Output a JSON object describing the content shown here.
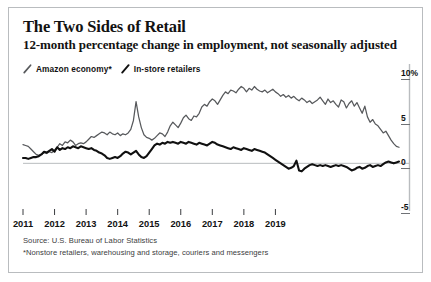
{
  "card": {
    "title": "The Two Sides of Retail",
    "subtitle": "12-month percentage change in employment, not seasonally adjusted",
    "source": "Source: U.S. Bureau of Labor Statistics",
    "footnote": "*Nonstore retailers, warehousing and storage, couriers and messengers",
    "border_color": "#b9bcbf",
    "background": "#ffffff"
  },
  "legend": {
    "position": "top-left",
    "entries": [
      {
        "label": "Amazon economy*",
        "color": "#57595c",
        "marker": "slash-line"
      },
      {
        "label": "In-store retailers",
        "color": "#101010",
        "marker": "slash-line"
      }
    ]
  },
  "chart_data": {
    "type": "line",
    "title": "The Two Sides of Retail",
    "subtitle": "12-month percentage change in employment, not seasonally adjusted",
    "xlabel": "",
    "ylabel": "",
    "grid": false,
    "zero_line": true,
    "ylim": [
      -5,
      10
    ],
    "yticks": [
      10,
      5,
      0,
      -5
    ],
    "ytick_labels": [
      "10%",
      "5",
      "0",
      "-5"
    ],
    "xlim": [
      "2011-01",
      "2019-12"
    ],
    "xticks": [
      "2011",
      "2012",
      "2013",
      "2014",
      "2015",
      "2016",
      "2017",
      "2018",
      "2019"
    ],
    "x_step_months": 1,
    "series": [
      {
        "name": "Amazon economy*",
        "color": "#57595c",
        "start": "2011-01",
        "values": [
          2.1,
          2.0,
          1.9,
          1.6,
          1.3,
          1.0,
          0.9,
          1.0,
          1.2,
          1.1,
          1.3,
          1.2,
          1.5,
          1.8,
          2.2,
          2.0,
          2.4,
          2.3,
          2.6,
          2.4,
          2.0,
          2.2,
          2.3,
          2.2,
          2.4,
          2.7,
          3.0,
          2.9,
          3.1,
          3.3,
          3.5,
          3.4,
          3.2,
          3.5,
          3.3,
          3.2,
          3.4,
          3.1,
          3.3,
          3.2,
          3.4,
          3.8,
          4.8,
          6.9,
          5.2,
          4.0,
          3.2,
          2.9,
          2.8,
          2.6,
          2.8,
          3.1,
          3.4,
          3.3,
          3.0,
          3.5,
          4.2,
          4.6,
          4.3,
          4.0,
          4.5,
          5.1,
          5.4,
          5.0,
          4.8,
          5.3,
          5.2,
          5.6,
          6.3,
          6.6,
          6.4,
          6.9,
          7.2,
          7.0,
          6.6,
          7.1,
          7.6,
          8.0,
          7.8,
          8.2,
          8.1,
          7.9,
          8.3,
          8.6,
          8.4,
          8.0,
          8.4,
          8.2,
          8.6,
          8.3,
          8.1,
          8.0,
          8.2,
          7.9,
          8.1,
          8.3,
          8.0,
          7.8,
          7.5,
          7.7,
          7.4,
          7.6,
          7.3,
          7.5,
          7.2,
          7.0,
          7.3,
          7.1,
          6.8,
          7.0,
          6.7,
          6.9,
          7.1,
          7.4,
          7.0,
          6.6,
          7.2,
          6.8,
          7.0,
          6.6,
          6.3,
          7.1,
          6.9,
          6.2,
          6.7,
          7.0,
          6.4,
          6.8,
          6.2,
          5.6,
          6.4,
          5.2,
          4.6,
          4.9,
          4.4,
          4.2,
          3.8,
          3.4,
          3.6,
          3.1,
          2.6,
          2.2,
          1.9,
          1.8
        ]
      },
      {
        "name": "In-store retailers",
        "color": "#101010",
        "start": "2011-01",
        "values": [
          0.6,
          0.6,
          0.5,
          0.6,
          0.7,
          0.7,
          0.8,
          1.0,
          1.3,
          1.2,
          1.4,
          1.6,
          1.3,
          1.8,
          1.5,
          1.7,
          1.6,
          1.8,
          1.7,
          1.9,
          1.8,
          1.7,
          1.9,
          1.8,
          1.7,
          1.6,
          1.7,
          1.5,
          1.4,
          1.2,
          1.1,
          0.9,
          0.6,
          0.5,
          0.6,
          0.7,
          0.6,
          0.8,
          1.1,
          1.3,
          1.2,
          1.0,
          1.2,
          1.4,
          1.0,
          0.7,
          0.6,
          0.8,
          1.2,
          1.6,
          2.0,
          2.2,
          2.1,
          2.3,
          2.2,
          2.4,
          2.3,
          2.4,
          2.3,
          2.2,
          2.4,
          2.3,
          2.2,
          2.4,
          2.3,
          2.2,
          2.1,
          2.3,
          2.2,
          2.1,
          2.0,
          2.2,
          2.4,
          2.3,
          2.1,
          2.0,
          1.9,
          1.8,
          1.7,
          1.6,
          1.8,
          1.7,
          1.6,
          1.5,
          1.7,
          1.6,
          1.5,
          1.4,
          1.6,
          1.5,
          1.4,
          1.3,
          1.2,
          1.0,
          0.8,
          0.6,
          0.4,
          0.2,
          0.0,
          -0.2,
          -0.4,
          -0.6,
          -0.5,
          -0.3,
          0.3,
          -0.8,
          -0.9,
          -0.6,
          -0.4,
          -0.2,
          -0.1,
          -0.2,
          -0.3,
          -0.2,
          -0.3,
          -0.2,
          -0.3,
          -0.4,
          -0.3,
          -0.2,
          -0.3,
          -0.2,
          -0.3,
          -0.4,
          -0.6,
          -0.8,
          -0.7,
          -0.5,
          -0.4,
          -0.6,
          -0.5,
          -0.3,
          -0.2,
          -0.4,
          -0.3,
          -0.2,
          -0.3,
          -0.1,
          0.1,
          0.2,
          0.1,
          0.0,
          0.1,
          0.2
        ]
      }
    ]
  }
}
